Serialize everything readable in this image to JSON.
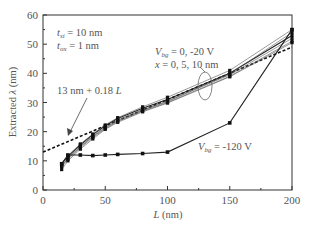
{
  "chart_data": {
    "type": "line",
    "title": "",
    "xlabel": "L (nm)",
    "ylabel": "Extracted λ (nm)",
    "xlim": [
      0,
      200
    ],
    "ylim": [
      0,
      60
    ],
    "xticks": [
      0,
      50,
      100,
      150,
      200
    ],
    "yticks": [
      0,
      10,
      20,
      30,
      40,
      50,
      60
    ],
    "grid": false,
    "legend": null,
    "annotations": [
      {
        "text": "t_si = 10 nm",
        "position": "top-left"
      },
      {
        "text": "t_ox = 1 nm",
        "position": "top-left"
      },
      {
        "text": "V_bg = 0, -20 V",
        "position": "upper-right"
      },
      {
        "text": "x = 0, 5, 10 nm",
        "position": "upper-right"
      },
      {
        "text": "13 nm + 0.18 L",
        "position": "middle-left",
        "arrow_to": [
          20,
          16.6
        ]
      },
      {
        "text": "V_bg = -120 V",
        "position": "lower-right"
      }
    ],
    "series": [
      {
        "name": "13 nm + 0.18 L (fit)",
        "style": "dashed",
        "x": [
          0,
          200
        ],
        "y": [
          13,
          49
        ]
      },
      {
        "name": "V_bg = 0 V, x = 0 nm",
        "style": "solid-marker",
        "x": [
          15,
          20,
          30,
          40,
          50,
          60,
          80,
          100,
          150,
          200
        ],
        "y": [
          9,
          11.5,
          15.5,
          19,
          22,
          24.5,
          28,
          31,
          40,
          53
        ]
      },
      {
        "name": "V_bg = 0 V, x = 5 nm",
        "style": "solid-marker",
        "x": [
          15,
          20,
          30,
          40,
          50,
          60,
          80,
          100,
          150,
          200
        ],
        "y": [
          8.5,
          11,
          15,
          18.5,
          21.5,
          24,
          27.5,
          30.5,
          39.5,
          52
        ]
      },
      {
        "name": "V_bg = 0 V, x = 10 nm",
        "style": "solid-marker",
        "x": [
          15,
          20,
          30,
          40,
          50,
          60,
          80,
          100,
          150,
          200
        ],
        "y": [
          8,
          10.5,
          14.5,
          18,
          21,
          23.5,
          27,
          30,
          39,
          51
        ]
      },
      {
        "name": "V_bg = -20 V, x = 0 nm",
        "style": "solid-marker",
        "x": [
          15,
          20,
          30,
          40,
          50,
          60,
          80,
          100,
          150,
          200
        ],
        "y": [
          9,
          11.8,
          15.8,
          19.2,
          22.3,
          24.8,
          28.5,
          31.8,
          41,
          55
        ]
      },
      {
        "name": "V_bg = -20 V, x = 5 nm",
        "style": "solid-marker",
        "x": [
          15,
          20,
          30,
          40,
          50,
          60,
          80,
          100,
          150,
          200
        ],
        "y": [
          8.2,
          10.8,
          14.8,
          18.3,
          21.3,
          23.8,
          27.3,
          30.3,
          39.8,
          54
        ]
      },
      {
        "name": "V_bg = -20 V, x = 10 nm",
        "style": "solid-marker",
        "x": [
          15,
          20,
          30,
          40,
          50,
          60,
          80,
          100,
          150,
          200
        ],
        "y": [
          7,
          10,
          14,
          17.5,
          20.8,
          23.2,
          26.8,
          29.8,
          38.8,
          50.5
        ]
      },
      {
        "name": "V_bg = -120 V",
        "style": "solid-marker",
        "x": [
          15,
          20,
          30,
          40,
          50,
          60,
          80,
          100,
          150,
          200
        ],
        "y": [
          9,
          12,
          12,
          11.8,
          12,
          12.2,
          12.5,
          13,
          23,
          55
        ]
      }
    ]
  },
  "labels": {
    "xlabel_L": "L",
    "xlabel_unit": "(nm)",
    "ylabel_prefix": "Extracted",
    "ylabel_lambda": "λ",
    "ylabel_unit": "(nm)",
    "tsi_t": "t",
    "tsi_sub": "si",
    "tsi_val": " = 10 nm",
    "tox_t": "t",
    "tox_sub": "ox",
    "tox_val": " = 1 nm",
    "vbg1_v": "V",
    "vbg1_sub": "bg",
    "vbg1_val": " = 0, -20 V",
    "x_line": "x",
    "x_val": " = 0, 5, 10 nm",
    "fit_text": "13 nm + 0.18 ",
    "fit_L": "L",
    "vbg2_v": "V",
    "vbg2_sub": "bg",
    "vbg2_val": " = -120 V"
  }
}
